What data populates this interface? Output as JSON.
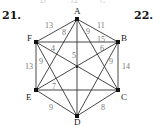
{
  "problem_numbers": {
    "left": "21.",
    "right": "22."
  },
  "cutoff_text": {
    "d": "D",
    "w": "12",
    "c": "C"
  },
  "vertices": [
    {
      "id": "A",
      "x": 77,
      "y": 19
    },
    {
      "id": "B",
      "x": 118,
      "y": 42
    },
    {
      "id": "C",
      "x": 118,
      "y": 90
    },
    {
      "id": "D",
      "x": 77,
      "y": 116
    },
    {
      "id": "E",
      "x": 36,
      "y": 90
    },
    {
      "id": "F",
      "x": 36,
      "y": 42
    }
  ],
  "edges": [
    {
      "from": "A",
      "to": "B",
      "weight": "11"
    },
    {
      "from": "B",
      "to": "C",
      "weight": "14"
    },
    {
      "from": "C",
      "to": "D",
      "weight": "8"
    },
    {
      "from": "D",
      "to": "E",
      "weight": "9"
    },
    {
      "from": "E",
      "to": "F",
      "weight": "13"
    },
    {
      "from": "F",
      "to": "A",
      "weight": "13"
    },
    {
      "from": "A",
      "to": "D",
      "weight": "5"
    },
    {
      "from": "F",
      "to": "B",
      "weight": "15"
    },
    {
      "from": "F",
      "to": "C",
      "weight": "4"
    },
    {
      "from": "B",
      "to": "E",
      "weight": "6"
    },
    {
      "from": "A",
      "to": "E",
      "weight": "8"
    },
    {
      "from": "A",
      "to": "C",
      "weight": "9"
    },
    {
      "from": "F",
      "to": "D",
      "weight": "9"
    },
    {
      "from": "B",
      "to": "D",
      "weight": "9"
    },
    {
      "from": "E",
      "to": "C",
      "weight": "7"
    }
  ]
}
